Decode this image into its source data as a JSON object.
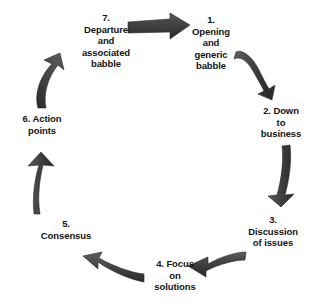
{
  "diagram": {
    "background_color": "#ffffff",
    "text_color": "#141414",
    "arrow_color_dark": "#333333",
    "arrow_color_light": "#565656",
    "arrow_direction": "clockwise",
    "nodes": [
      {
        "id": "1",
        "number": "1.",
        "label": "1.\nOpening\nand\ngeneric\nbabble",
        "position": "top-right"
      },
      {
        "id": "2",
        "number": "2.",
        "label": "2. Down\nto\nbusiness",
        "position": "right-upper"
      },
      {
        "id": "3",
        "number": "3.",
        "label": "3.\nDiscussion\nof issues",
        "position": "right-lower"
      },
      {
        "id": "4",
        "number": "4.",
        "label": "4. Focus\non\nsolutions",
        "position": "bottom"
      },
      {
        "id": "5",
        "number": "5.",
        "label": "5.\nConsensus",
        "position": "left-lower"
      },
      {
        "id": "6",
        "number": "6.",
        "label": "6. Action\npoints",
        "position": "left-upper"
      },
      {
        "id": "7",
        "number": "7.",
        "label": "7.\nDeparture\nand\nassociated\nbabble",
        "position": "top-left"
      }
    ],
    "connectors": [
      {
        "from": "7",
        "to": "1",
        "name": "arrow-7-to-1",
        "shape": "straight-right"
      },
      {
        "from": "1",
        "to": "2",
        "name": "arrow-1-to-2",
        "shape": "curved-down-right"
      },
      {
        "from": "2",
        "to": "3",
        "name": "arrow-2-to-3",
        "shape": "curved-down"
      },
      {
        "from": "3",
        "to": "4",
        "name": "arrow-3-to-4",
        "shape": "curved-left"
      },
      {
        "from": "4",
        "to": "5",
        "name": "arrow-4-to-5",
        "shape": "curved-up-left"
      },
      {
        "from": "5",
        "to": "6",
        "name": "arrow-5-to-6",
        "shape": "curved-up"
      },
      {
        "from": "6",
        "to": "7",
        "name": "arrow-6-to-7",
        "shape": "curved-up-right"
      }
    ]
  }
}
